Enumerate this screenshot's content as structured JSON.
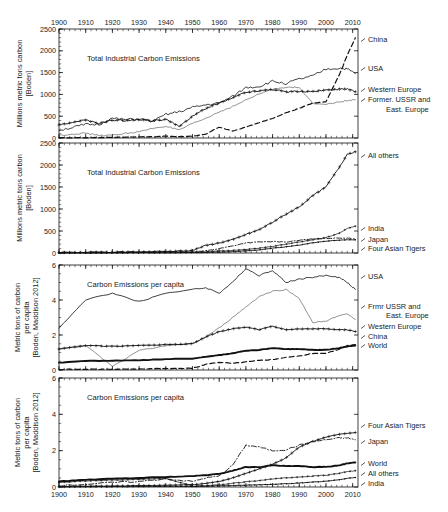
{
  "figure": {
    "width": 448,
    "height": 512,
    "background": "#ffffff",
    "ink": "#111111"
  },
  "chart_data": [
    {
      "type": "line",
      "panel": 1,
      "title": "Total Industrial Carbon Emissions",
      "xlabel": "",
      "ylabel": "Millions metric tons carbon [Boden]",
      "xlim": [
        1900,
        2012
      ],
      "ylim": [
        0,
        2500
      ],
      "xticks": [
        1900,
        1910,
        1920,
        1930,
        1940,
        1950,
        1960,
        1970,
        1980,
        1990,
        2000,
        2010
      ],
      "yticks": [
        0,
        500,
        1000,
        1500,
        2000,
        2500
      ],
      "xtick_position": "top",
      "grid": false,
      "legend": "right-inline",
      "x": [
        1900,
        1905,
        1910,
        1915,
        1920,
        1925,
        1930,
        1935,
        1940,
        1945,
        1950,
        1955,
        1960,
        1965,
        1970,
        1975,
        1980,
        1985,
        1990,
        1995,
        2000,
        2005,
        2008,
        2011
      ],
      "series": [
        {
          "name": "USA",
          "style": "solid-thin",
          "values": [
            180,
            240,
            310,
            310,
            450,
            420,
            440,
            370,
            540,
            600,
            700,
            760,
            800,
            950,
            1160,
            1180,
            1300,
            1250,
            1350,
            1420,
            1580,
            1600,
            1580,
            1480
          ]
        },
        {
          "name": "Western Europe",
          "style": "solid-crossmark",
          "values": [
            300,
            360,
            410,
            330,
            410,
            400,
            420,
            400,
            430,
            260,
            500,
            680,
            800,
            920,
            1050,
            1080,
            1120,
            1060,
            1070,
            1070,
            1100,
            1120,
            1120,
            1060
          ]
        },
        {
          "name": "Former. USSR and East. Europe",
          "style": "solid-thin-light",
          "values": [
            60,
            90,
            110,
            60,
            60,
            110,
            140,
            220,
            270,
            180,
            330,
            450,
            600,
            720,
            870,
            1010,
            1120,
            1170,
            1150,
            800,
            780,
            820,
            860,
            880
          ]
        },
        {
          "name": "China",
          "style": "dashed",
          "values": [
            5,
            5,
            8,
            10,
            15,
            20,
            25,
            30,
            40,
            30,
            40,
            90,
            250,
            160,
            250,
            350,
            450,
            580,
            680,
            800,
            830,
            1450,
            1900,
            2300
          ]
        }
      ]
    },
    {
      "type": "line",
      "panel": 2,
      "title": "Total Industrial Carbon Emissions",
      "xlabel": "",
      "ylabel": "Millions metric tons carbon [Boden]",
      "xlim": [
        1900,
        2012
      ],
      "ylim": [
        0,
        2500
      ],
      "xticks": [
        1900,
        1910,
        1920,
        1930,
        1940,
        1950,
        1960,
        1970,
        1980,
        1990,
        2000,
        2010
      ],
      "yticks": [
        0,
        500,
        1000,
        1500,
        2000,
        2500
      ],
      "xtick_position": "none",
      "grid": false,
      "legend": "right-inline",
      "x": [
        1900,
        1910,
        1920,
        1930,
        1940,
        1950,
        1955,
        1960,
        1965,
        1970,
        1975,
        1980,
        1985,
        1990,
        1995,
        2000,
        2005,
        2008,
        2011
      ],
      "series": [
        {
          "name": "All others",
          "style": "solid-crossmark",
          "values": [
            10,
            15,
            20,
            25,
            35,
            60,
            170,
            230,
            300,
            420,
            530,
            700,
            880,
            1050,
            1300,
            1500,
            1950,
            2250,
            2300
          ]
        },
        {
          "name": "India",
          "style": "solid-crossmark-thin",
          "values": [
            4,
            6,
            8,
            10,
            15,
            20,
            30,
            45,
            60,
            80,
            110,
            150,
            200,
            250,
            300,
            350,
            450,
            560,
            610
          ]
        },
        {
          "name": "Japan",
          "style": "dash-dot",
          "values": [
            3,
            6,
            12,
            18,
            25,
            25,
            50,
            100,
            160,
            230,
            250,
            260,
            250,
            290,
            320,
            330,
            340,
            340,
            320
          ]
        },
        {
          "name": "Four Asian Tigers",
          "style": "solid-dotmark",
          "values": [
            1,
            2,
            3,
            5,
            6,
            8,
            12,
            20,
            30,
            50,
            70,
            110,
            140,
            180,
            230,
            270,
            290,
            300,
            300
          ]
        }
      ]
    },
    {
      "type": "line",
      "panel": 3,
      "title": "Carbon Emissions per capita",
      "xlabel": "",
      "ylabel": "Metric tons of carbon per capita [Boden, Maddison 2012]",
      "xlim": [
        1900,
        2012
      ],
      "ylim": [
        0,
        6
      ],
      "xticks": [
        1900,
        1910,
        1920,
        1930,
        1940,
        1950,
        1960,
        1970,
        1980,
        1990,
        2000,
        2010
      ],
      "yticks": [
        0,
        2,
        4,
        6
      ],
      "xtick_position": "none",
      "grid": false,
      "legend": "right-inline",
      "x": [
        1900,
        1910,
        1920,
        1930,
        1940,
        1950,
        1955,
        1960,
        1965,
        1970,
        1975,
        1980,
        1985,
        1990,
        1995,
        2000,
        2005,
        2008,
        2011
      ],
      "series": [
        {
          "name": "USA",
          "style": "solid-thin",
          "values": [
            2.4,
            4.0,
            4.4,
            3.9,
            4.4,
            4.6,
            4.7,
            4.4,
            5.0,
            5.8,
            5.4,
            5.7,
            5.0,
            5.2,
            5.3,
            5.4,
            5.3,
            5.0,
            4.6
          ]
        },
        {
          "name": "Frmr USSR and East. Europe",
          "style": "solid-thin-light",
          "values": [
            1.2,
            1.4,
            0.2,
            1.1,
            1.4,
            1.5,
            1.9,
            2.4,
            3.0,
            3.6,
            4.2,
            4.5,
            4.6,
            4.1,
            2.7,
            2.8,
            3.1,
            3.2,
            2.9
          ]
        },
        {
          "name": "Western Europe",
          "style": "solid-crossmark",
          "values": [
            1.2,
            1.4,
            1.35,
            1.4,
            1.45,
            1.5,
            1.9,
            2.2,
            2.35,
            2.45,
            2.3,
            2.5,
            2.3,
            2.35,
            2.35,
            2.35,
            2.3,
            2.3,
            2.2
          ]
        },
        {
          "name": "China",
          "style": "dashed",
          "values": [
            0.03,
            0.04,
            0.05,
            0.06,
            0.08,
            0.1,
            0.32,
            0.45,
            0.38,
            0.46,
            0.55,
            0.6,
            0.72,
            0.8,
            0.95,
            0.95,
            1.2,
            1.4,
            1.45
          ]
        },
        {
          "name": "World",
          "style": "solid-thick",
          "values": [
            0.42,
            0.52,
            0.53,
            0.55,
            0.62,
            0.65,
            0.75,
            0.85,
            0.95,
            1.1,
            1.15,
            1.25,
            1.2,
            1.2,
            1.15,
            1.15,
            1.25,
            1.35,
            1.4
          ]
        }
      ]
    },
    {
      "type": "line",
      "panel": 4,
      "title": "Carbon Emissions per capita",
      "xlabel": "",
      "ylabel": "Metric tons of carbon per capita [Boden, Maddison 2012]",
      "xlim": [
        1900,
        2012
      ],
      "ylim": [
        0,
        6
      ],
      "xticks": [
        1900,
        1910,
        1920,
        1930,
        1940,
        1950,
        1960,
        1970,
        1980,
        1990,
        2000,
        2010
      ],
      "yticks": [
        0,
        2,
        4,
        6
      ],
      "xtick_position": "bottom",
      "grid": false,
      "legend": "right-inline",
      "x": [
        1900,
        1910,
        1920,
        1930,
        1940,
        1950,
        1955,
        1960,
        1965,
        1970,
        1975,
        1980,
        1985,
        1990,
        1995,
        2000,
        2005,
        2008,
        2011
      ],
      "series": [
        {
          "name": "Four Asian Tigers",
          "style": "solid-crossmark",
          "values": [
            0.02,
            0.04,
            0.05,
            0.07,
            0.1,
            0.12,
            0.2,
            0.3,
            0.5,
            0.75,
            1.0,
            1.25,
            1.6,
            2.2,
            2.5,
            2.75,
            2.9,
            2.95,
            3.0
          ]
        },
        {
          "name": "Japan",
          "style": "dash-dot",
          "values": [
            0.08,
            0.15,
            0.25,
            0.3,
            0.45,
            0.3,
            0.5,
            0.6,
            1.2,
            2.3,
            2.2,
            2.0,
            2.05,
            2.3,
            2.5,
            2.6,
            2.7,
            2.7,
            2.6
          ]
        },
        {
          "name": "World",
          "style": "solid-thick",
          "values": [
            0.3,
            0.4,
            0.45,
            0.5,
            0.55,
            0.6,
            0.65,
            0.72,
            0.9,
            1.1,
            1.1,
            1.2,
            1.15,
            1.15,
            1.1,
            1.1,
            1.2,
            1.3,
            1.35
          ]
        },
        {
          "name": "All others",
          "style": "solid-crossmark-thin",
          "values": [
            0.25,
            0.33,
            0.38,
            0.42,
            0.48,
            0.05,
            0.08,
            0.12,
            0.2,
            0.28,
            0.35,
            0.45,
            0.5,
            0.55,
            0.6,
            0.65,
            0.75,
            0.85,
            0.9
          ]
        },
        {
          "name": "India",
          "style": "solid-dotmark",
          "values": [
            0.01,
            0.02,
            0.02,
            0.03,
            0.04,
            0.03,
            0.04,
            0.06,
            0.08,
            0.1,
            0.12,
            0.15,
            0.18,
            0.22,
            0.27,
            0.32,
            0.4,
            0.48,
            0.52
          ]
        }
      ]
    }
  ],
  "panels": [
    {
      "id": "panel1",
      "title": "Total Industrial Carbon Emissions",
      "ylabel_line1": "Millions metric tons carbon",
      "ylabel_line2": "[Boden]",
      "yticks": [
        "0",
        "500",
        "1000",
        "1500",
        "2000",
        "2500"
      ],
      "labels": [
        {
          "text": "China"
        },
        {
          "text": "USA"
        },
        {
          "text": "Western Europe"
        },
        {
          "text": "Former. USSR and"
        },
        {
          "text": "East. Europe"
        }
      ]
    },
    {
      "id": "panel2",
      "title": "Total Industrial Carbon Emissions",
      "ylabel_line1": "Millions metric tons carbon",
      "ylabel_line2": "[Boden]",
      "yticks": [
        "0",
        "500",
        "1000",
        "1500",
        "2000",
        "2500"
      ],
      "labels": [
        {
          "text": "All others"
        },
        {
          "text": "India"
        },
        {
          "text": "Japan"
        },
        {
          "text": "Four Asian Tigers"
        }
      ]
    },
    {
      "id": "panel3",
      "title": "Carbon Emissions per capita",
      "ylabel_line1": "Metric tons of carbon",
      "ylabel_line2": "per capita",
      "ylabel_line3": "[Boden, Maddison 2012]",
      "yticks": [
        "0",
        "2",
        "4",
        "6"
      ],
      "labels": [
        {
          "text": "USA"
        },
        {
          "text": "Frmr USSR and"
        },
        {
          "text": "East. Europe"
        },
        {
          "text": "Western Europe"
        },
        {
          "text": "China"
        },
        {
          "text": "World"
        }
      ]
    },
    {
      "id": "panel4",
      "title": "Carbon Emissions per capita",
      "ylabel_line1": "Metric tons of carbon",
      "ylabel_line2": "per capita",
      "ylabel_line3": "[Boden, Maddison 2012]",
      "yticks": [
        "0",
        "2",
        "4",
        "6"
      ],
      "labels": [
        {
          "text": "Four Asian Tigers"
        },
        {
          "text": "Japan"
        },
        {
          "text": "World"
        },
        {
          "text": "All others"
        },
        {
          "text": "India"
        }
      ]
    }
  ],
  "xticks": [
    "1900",
    "1910",
    "1920",
    "1930",
    "1940",
    "1950",
    "1960",
    "1970",
    "1980",
    "1990",
    "2000",
    "2010"
  ]
}
